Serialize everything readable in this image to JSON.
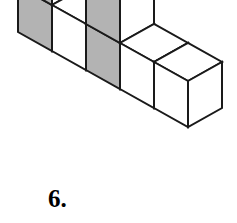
{
  "figure": {
    "kind": "isometric-cube-assembly",
    "label": "6.",
    "colors": {
      "top_face": "#ffffff",
      "right_face": "#ffffff",
      "left_face_shaded": "#b3b3b3",
      "left_face_plain": "#ffffff",
      "outline": "#1a1a1a",
      "background": "#ffffff",
      "label_color": "#000000"
    },
    "projection": {
      "origin_x": 18,
      "origin_y": 32,
      "half_width": 34,
      "half_rise": 19,
      "cube_height": 46,
      "stroke_width": 2
    },
    "cubes": [
      {
        "name": "back-row-left-top",
        "ix": 0,
        "iy": 0,
        "iz": 2,
        "shaded": true
      },
      {
        "name": "back-row-left-mid",
        "ix": 0,
        "iy": 0,
        "iz": 1,
        "shaded": true
      },
      {
        "name": "back-row-left-bottom",
        "ix": 0,
        "iy": 0,
        "iz": 0,
        "shaded": true
      },
      {
        "name": "back-row-mid-top",
        "ix": 1,
        "iy": 0,
        "iz": 2,
        "shaded": true
      },
      {
        "name": "back-row-mid-bottom",
        "ix": 1,
        "iy": 0,
        "iz": 0,
        "shaded": false
      },
      {
        "name": "back-row-right-top",
        "ix": 2,
        "iy": 0,
        "iz": 2,
        "shaded": true
      },
      {
        "name": "back-row-right-mid",
        "ix": 2,
        "iy": 0,
        "iz": 1,
        "shaded": true
      },
      {
        "name": "back-row-right-bottom",
        "ix": 2,
        "iy": 0,
        "iz": 0,
        "shaded": true
      },
      {
        "name": "front-arm-near",
        "ix": 3,
        "iy": 0,
        "iz": 0,
        "shaded": false
      },
      {
        "name": "front-arm-far",
        "ix": 4,
        "iy": 0,
        "iz": 0,
        "shaded": false
      }
    ],
    "cube_count": 10
  }
}
